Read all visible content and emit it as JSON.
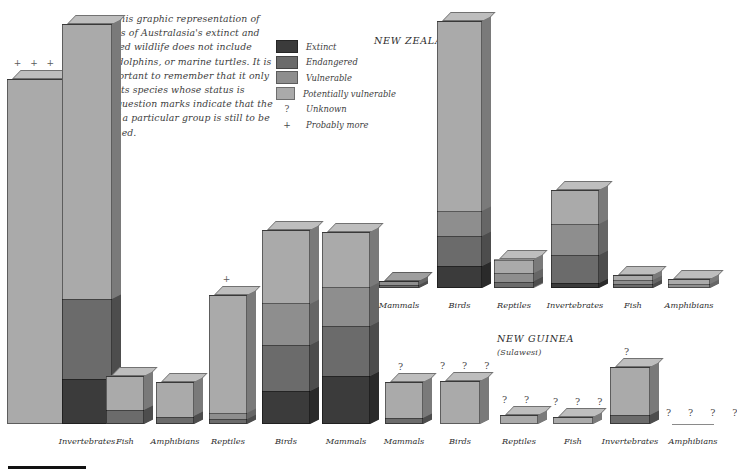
{
  "intro": {
    "lead": "Below",
    "body": " This graphic representation of the status of Australasia's extinct and threatened wildlife does not include whales, dolphins, or marine turtles. It is also important to remember that it only represents species whose status is known; question marks indicate that the status of a particular group is still to be determined."
  },
  "legend": {
    "items": [
      {
        "label": "Extinct",
        "type": "swatch",
        "color": "#3b3b3b"
      },
      {
        "label": "Endangered",
        "type": "swatch",
        "color": "#6b6b6b"
      },
      {
        "label": "Vulnerable",
        "type": "swatch",
        "color": "#8e8e8e"
      },
      {
        "label": "Potentially vulnerable",
        "type": "swatch",
        "color": "#aaaaaa"
      },
      {
        "label": "Unknown",
        "type": "mark",
        "mark": "?"
      },
      {
        "label": "Probably more",
        "type": "mark",
        "mark": "+"
      }
    ]
  },
  "regions": [
    {
      "name": "NEW ZEALAND",
      "sub": ""
    },
    {
      "name": "NEW GUINEA",
      "sub": "(Sulawesi)"
    }
  ],
  "colors": {
    "extinct": "#3b3b3b",
    "endangered": "#6b6b6b",
    "vulnerable": "#8e8e8e",
    "potentially_vulnerable": "#aaaaaa"
  },
  "chart_data": {
    "type": "bar",
    "title": "Status of Australasia's extinct and threatened wildlife",
    "stacked": true,
    "series_order": [
      "potentially_vulnerable",
      "vulnerable",
      "endangered",
      "extinct"
    ],
    "legend_position": "top-left",
    "ylabel": "",
    "xlabel": "",
    "groups": [
      {
        "region": "Australia",
        "bars": [
          {
            "category": "Invertebrates",
            "annotation": "+ + +",
            "segments": {
              "potentially_vulnerable": 345,
              "vulnerable": 0,
              "endangered": 0,
              "extinct": 0
            }
          },
          {
            "category": "Invertebrates",
            "annotation": "",
            "segments": {
              "potentially_vulnerable": 275,
              "vulnerable": 0,
              "endangered": 80,
              "extinct": 45
            }
          },
          {
            "category": "Fish",
            "annotation": "",
            "segments": {
              "potentially_vulnerable": 55,
              "vulnerable": 0,
              "endangered": 22,
              "extinct": 0
            }
          },
          {
            "category": "Amphibians",
            "annotation": "",
            "segments": {
              "potentially_vulnerable": 55,
              "vulnerable": 0,
              "endangered": 12,
              "extinct": 0
            }
          },
          {
            "category": "Reptiles",
            "annotation": "+",
            "segments": {
              "potentially_vulnerable": 190,
              "vulnerable": 10,
              "endangered": 8,
              "extinct": 0
            }
          },
          {
            "category": "Birds",
            "annotation": "",
            "segments": {
              "potentially_vulnerable": 80,
              "vulnerable": 45,
              "endangered": 50,
              "extinct": 36
            }
          },
          {
            "category": "Mammals",
            "annotation": "",
            "segments": {
              "potentially_vulnerable": 60,
              "vulnerable": 42,
              "endangered": 55,
              "extinct": 52
            }
          }
        ]
      },
      {
        "region": "New Zealand",
        "bars": [
          {
            "category": "Mammals",
            "annotation": "",
            "segments": {
              "potentially_vulnerable": 0,
              "vulnerable": 6,
              "endangered": 5,
              "extinct": 0
            }
          },
          {
            "category": "Birds",
            "annotation": "",
            "segments": {
              "potentially_vulnerable": 190,
              "vulnerable": 25,
              "endangered": 30,
              "extinct": 22
            }
          },
          {
            "category": "Reptiles",
            "annotation": "",
            "segments": {
              "potentially_vulnerable": 22,
              "vulnerable": 14,
              "endangered": 10,
              "extinct": 0
            }
          },
          {
            "category": "Invertebrates",
            "annotation": "",
            "segments": {
              "potentially_vulnerable": 55,
              "vulnerable": 50,
              "endangered": 45,
              "extinct": 8
            }
          },
          {
            "category": "Fish",
            "annotation": "",
            "segments": {
              "potentially_vulnerable": 8,
              "vulnerable": 7,
              "endangered": 6,
              "extinct": 0
            }
          },
          {
            "category": "Amphibians",
            "annotation": "",
            "segments": {
              "potentially_vulnerable": 8,
              "vulnerable": 6,
              "endangered": 0,
              "extinct": 0
            }
          }
        ]
      },
      {
        "region": "New Guinea",
        "bars": [
          {
            "category": "Mammals",
            "annotation": "?",
            "segments": {
              "potentially_vulnerable": 58,
              "vulnerable": 0,
              "endangered": 10,
              "extinct": 0
            }
          },
          {
            "category": "Birds",
            "annotation": "? ? ?",
            "segments": {
              "potentially_vulnerable": 70,
              "vulnerable": 0,
              "endangered": 0,
              "extinct": 0
            }
          },
          {
            "category": "Reptiles",
            "annotation": "? ?",
            "segments": {
              "potentially_vulnerable": 14,
              "vulnerable": 0,
              "endangered": 0,
              "extinct": 0
            }
          },
          {
            "category": "Fish",
            "annotation": "? ? ?",
            "segments": {
              "potentially_vulnerable": 12,
              "vulnerable": 0,
              "endangered": 0,
              "extinct": 0
            }
          },
          {
            "category": "Invertebrates",
            "annotation": "?",
            "segments": {
              "potentially_vulnerable": 78,
              "vulnerable": 0,
              "endangered": 14,
              "extinct": 0
            }
          },
          {
            "category": "Amphibians",
            "annotation": "? ? ? ?",
            "segments": {
              "potentially_vulnerable": 0,
              "vulnerable": 0,
              "endangered": 0,
              "extinct": 0
            }
          }
        ]
      }
    ]
  }
}
